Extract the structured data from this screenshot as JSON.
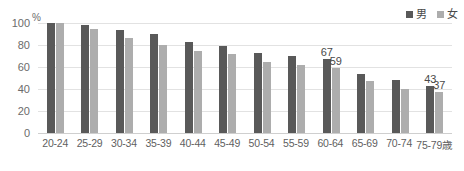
{
  "chart_data": {
    "type": "bar",
    "title": "",
    "xlabel": "",
    "ylabel": "%",
    "unit_label": "%",
    "ylim": [
      0,
      100
    ],
    "yticks": [
      100,
      80,
      60,
      40,
      20,
      0
    ],
    "grid": true,
    "legend_position": "top-right",
    "categories": [
      "20-24",
      "25-29",
      "30-34",
      "35-39",
      "40-44",
      "45-49",
      "50-54",
      "55-59",
      "60-64",
      "65-69",
      "70-74",
      "75-79歳"
    ],
    "series": [
      {
        "name": "男",
        "color": "#595959",
        "values": [
          100,
          98,
          94,
          90,
          83,
          79,
          73,
          70,
          67,
          54,
          48,
          43
        ],
        "labels": [
          "",
          "",
          "",
          "",
          "",
          "",
          "",
          "",
          "67",
          "",
          "",
          "43"
        ]
      },
      {
        "name": "女",
        "color": "#adadad",
        "values": [
          100,
          95,
          86,
          80,
          75,
          72,
          65,
          62,
          59,
          47,
          40,
          37
        ],
        "labels": [
          "",
          "",
          "",
          "",
          "",
          "",
          "",
          "",
          "59",
          "",
          "",
          "37"
        ]
      }
    ]
  },
  "legend": {
    "items": [
      {
        "label": "男",
        "color": "#595959"
      },
      {
        "label": "女",
        "color": "#adadad"
      }
    ]
  },
  "axis": {
    "unit": "%",
    "yticks": [
      "100",
      "80",
      "60",
      "40",
      "20",
      "0"
    ]
  }
}
